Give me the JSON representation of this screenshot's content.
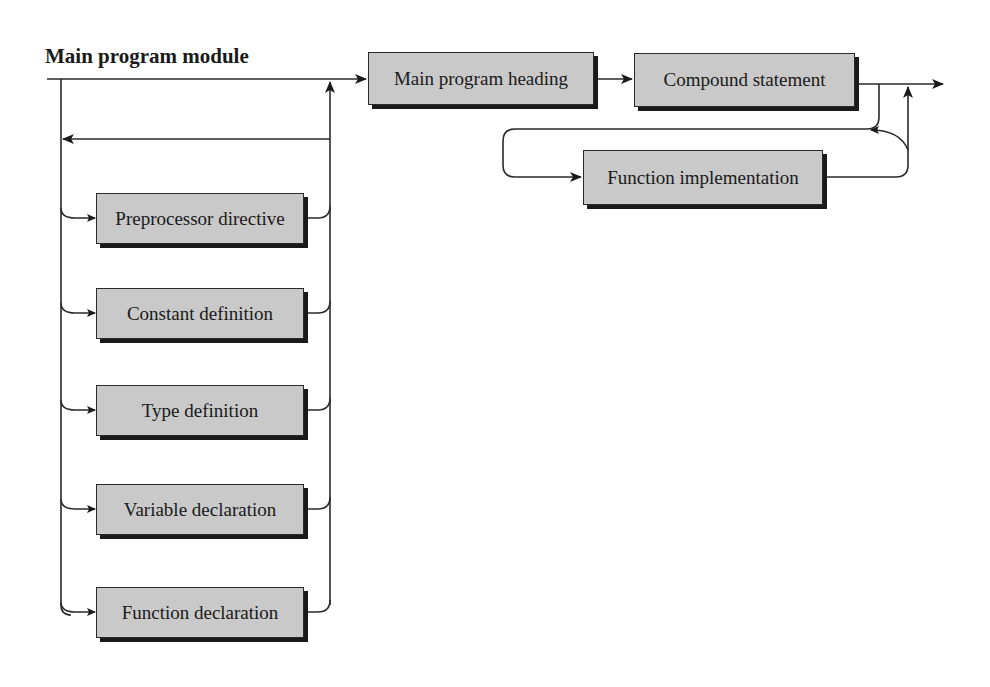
{
  "diagram": {
    "title": "Main program module",
    "main_flow": [
      {
        "id": "main-heading",
        "label": "Main program heading"
      },
      {
        "id": "compound",
        "label": "Compound statement"
      }
    ],
    "loop_box": {
      "id": "func-impl",
      "label": "Function implementation"
    },
    "declarations": [
      {
        "id": "preprocessor",
        "label": "Preprocessor directive"
      },
      {
        "id": "constant",
        "label": "Constant definition"
      },
      {
        "id": "type",
        "label": "Type definition"
      },
      {
        "id": "variable",
        "label": "Variable declaration"
      },
      {
        "id": "function-decl",
        "label": "Function declaration"
      }
    ],
    "colors": {
      "box_fill": "#c9c9c9",
      "line": "#2a2a2a",
      "shadow": "#1a1a1a"
    }
  }
}
